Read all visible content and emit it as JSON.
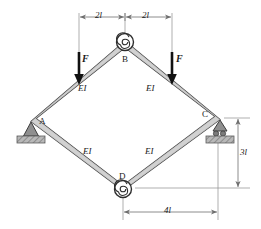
{
  "figure": {
    "colors": {
      "member_fill": "#c9c9c9",
      "member_stroke": "#3a3a3a",
      "ground_hatch": "#9a9a9a",
      "dimension_line": "#6e6e6e",
      "force_arrow": "#111111",
      "text": "#1a1a1a"
    }
  },
  "nodes": [
    {
      "id": "A",
      "label": "A",
      "x": 33,
      "y": 120,
      "support": "pinned"
    },
    {
      "id": "B",
      "label": "B",
      "x": 125,
      "y": 44,
      "support": "spiral-hinge"
    },
    {
      "id": "C",
      "label": "C",
      "x": 218,
      "y": 118,
      "support": "roller"
    },
    {
      "id": "D",
      "label": "D",
      "x": 123,
      "y": 188,
      "support": "spiral-hinge"
    }
  ],
  "members": [
    {
      "id": "AB",
      "from": "A",
      "to": "B",
      "stiffness_label": "EI"
    },
    {
      "id": "BC",
      "from": "B",
      "to": "C",
      "stiffness_label": "EI"
    },
    {
      "id": "CD",
      "from": "C",
      "to": "D",
      "stiffness_label": "EI"
    },
    {
      "id": "DA",
      "from": "D",
      "to": "A",
      "stiffness_label": "EI"
    }
  ],
  "stiffness_labels": {
    "upper_left": "EI",
    "upper_right": "EI",
    "lower_left": "EI",
    "lower_right": "EI"
  },
  "loads": [
    {
      "id": "F-left",
      "label": "F",
      "direction": "down",
      "x": 79,
      "applied_to": "AB"
    },
    {
      "id": "F-right",
      "label": "F",
      "direction": "down",
      "x": 172,
      "applied_to": "BC"
    }
  ],
  "dimensions": [
    {
      "id": "top-left",
      "label": "2l",
      "orientation": "horizontal",
      "from_x": 79,
      "to_x": 125,
      "y": 17
    },
    {
      "id": "top-right",
      "label": "2l",
      "orientation": "horizontal",
      "from_x": 125,
      "to_x": 172,
      "y": 17
    },
    {
      "id": "right-total",
      "label": "3l",
      "orientation": "vertical",
      "from_y": 118,
      "to_y": 188,
      "x": 238
    },
    {
      "id": "bottom",
      "label": "4l",
      "orientation": "horizontal",
      "from_x": 123,
      "to_x": 218,
      "y": 212
    }
  ],
  "support_symbols": {
    "pinned": "triangle-hatched-ground",
    "roller": "triangle-rollers-hatched-ground",
    "spiral_hinge": "spiral-pin"
  }
}
